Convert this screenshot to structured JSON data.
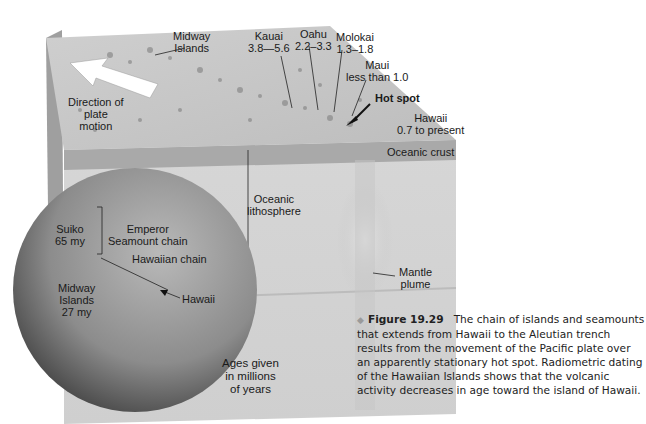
{
  "block": {
    "labels": {
      "midway_top": [
        "Midway",
        "Islands"
      ],
      "kauai": [
        "Kauai",
        "3.8—5.6"
      ],
      "oahu": [
        "Oahu",
        "2.2–3.3"
      ],
      "molokai": [
        "Molokai",
        "1.3–1.8"
      ],
      "maui": [
        "Maui",
        "less than 1.0"
      ],
      "hot_spot": "Hot spot",
      "hawaii_top": [
        "Hawaii",
        "0.7 to present"
      ],
      "oceanic_crust": "Oceanic crust",
      "direction": [
        "Direction of",
        "plate",
        "motion"
      ],
      "lithosphere": [
        "Oceanic",
        "lithosphere"
      ],
      "mantle_plume": [
        "Mantle",
        "plume"
      ]
    }
  },
  "globe": {
    "labels": {
      "suiko": [
        "Suiko",
        "65 my"
      ],
      "emperor": [
        "Emperor",
        "Seamount chain"
      ],
      "hawaiian_chain": "Hawaiian chain",
      "midway": [
        "Midway",
        "Islands",
        "27 my"
      ],
      "hawaii": "Hawaii"
    }
  },
  "ages_note": [
    "Ages given",
    "in millions",
    "of years"
  ],
  "caption": {
    "figure_number": "Figure 19.29",
    "text": "The chain of islands and seamounts that extends from Hawaii to the Aleutian trench results from the movement of the Pacific plate over an apparently stationary hot spot. Radiometric dating of the Hawaiian Islands shows that the volcanic activity decreases in age toward the island of Hawaii."
  }
}
